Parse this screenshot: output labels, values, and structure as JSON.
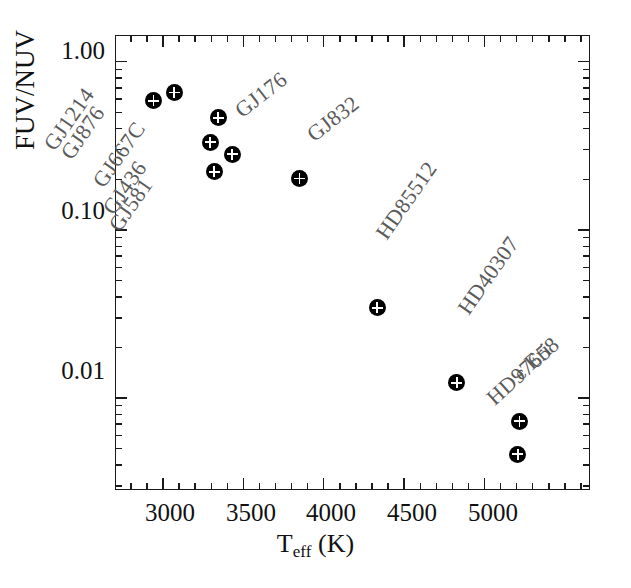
{
  "chart_data": {
    "type": "scatter",
    "title": "",
    "xlabel": "T_eff (K)",
    "ylabel": "FUV/NUV",
    "xlabel_main": "T",
    "xlabel_sub": "eff",
    "xlabel_unit": " (K)",
    "xscale": "linear",
    "yscale": "log",
    "xlim": [
      2712,
      5654
    ],
    "ylim": [
      0.00285,
      1.41
    ],
    "grid": false,
    "legend": "none",
    "xticks": [
      3000,
      3500,
      4000,
      4500,
      5000
    ],
    "xticklabels": [
      "3000",
      "3500",
      "4000",
      "4500",
      "5000"
    ],
    "xminorticks": [
      2800,
      2900,
      3100,
      3200,
      3300,
      3400,
      3600,
      3700,
      3800,
      3900,
      4100,
      4200,
      4300,
      4400,
      4600,
      4700,
      4800,
      4900,
      5100,
      5200,
      5300,
      5400,
      5500,
      5600
    ],
    "yticks": [
      1.0,
      0.1,
      0.01
    ],
    "yticklabels": [
      "1.00",
      "0.10",
      "0.01"
    ],
    "points": [
      {
        "label": "GJ1214",
        "x": 2945,
        "y": 0.58,
        "label_angle": -55,
        "label_dx": -104,
        "label_dy": 36
      },
      {
        "label": "GJ876",
        "x": 3075,
        "y": 0.65,
        "label_angle": -55,
        "label_dx": -108,
        "label_dy": 53
      },
      {
        "label": "GJ667C",
        "x": 3347,
        "y": 0.46,
        "label_angle": -55,
        "label_dx": -120,
        "label_dy": 56
      },
      {
        "label": "GJ436",
        "x": 3298,
        "y": 0.33,
        "label_angle": -55,
        "label_dx": -102,
        "label_dy": 59
      },
      {
        "label": "GJ581",
        "x": 3322,
        "y": 0.22,
        "label_angle": -55,
        "label_dx": -100,
        "label_dy": 46
      },
      {
        "label": "GJ176",
        "x": 3434,
        "y": 0.28,
        "label_angle": -38,
        "label_dx": 6,
        "label_dy": -52
      },
      {
        "label": "GJ832",
        "x": 3854,
        "y": 0.2,
        "label_angle": -38,
        "label_dx": 10,
        "label_dy": -53
      },
      {
        "label": "HD85512",
        "x": 4337,
        "y": 0.034,
        "label_angle": -55,
        "label_dx": 4,
        "label_dy": -82
      },
      {
        "label": "HD40307",
        "x": 4832,
        "y": 0.0122,
        "label_angle": -55,
        "label_dx": 6,
        "label_dy": -82
      },
      {
        "label": "ϵ Eri",
        "x": 5222,
        "y": 0.0072,
        "label_angle": -42,
        "label_dx": -4,
        "label_dy": -56
      },
      {
        "label": "HD97658",
        "x": 5210,
        "y": 0.0046,
        "label_angle": -42,
        "label_dx": -28,
        "label_dy": -64
      }
    ]
  },
  "colors": {
    "marker_fill": "#000000",
    "marker_cross": "#ffffff",
    "axis": "#1a1a1a",
    "label_text": "#5a5a5a",
    "tick_text": "#111111",
    "background": "#ffffff"
  }
}
